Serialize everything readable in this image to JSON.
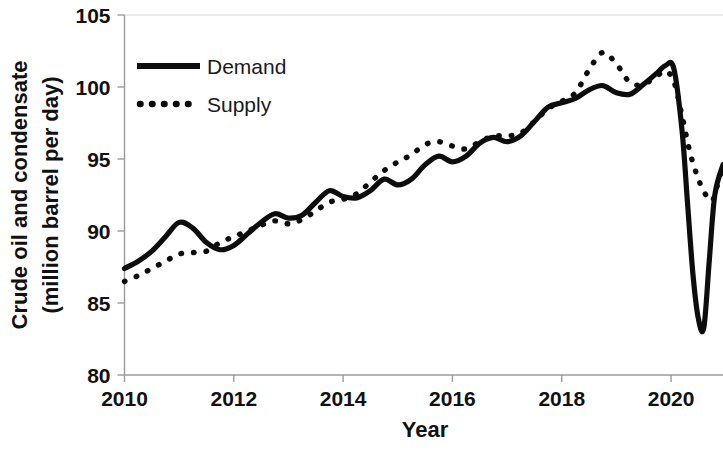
{
  "chart_data": {
    "type": "line",
    "title": "",
    "xlabel": "Year",
    "ylabel": "Crude oil and condensate (million barrel per day)",
    "ylabel_line1": "Crude oil and condensate",
    "ylabel_line2": "(million barrel per day)",
    "xlim": [
      2010.0,
      2020.95
    ],
    "ylim": [
      80,
      105
    ],
    "xticks": [
      2010,
      2012,
      2014,
      2016,
      2018,
      2020
    ],
    "xtick_labels": [
      "2010",
      "2012",
      "2014",
      "2016",
      "2018",
      "2020"
    ],
    "yticks": [
      80,
      85,
      90,
      95,
      100,
      105
    ],
    "ytick_labels": [
      "80",
      "85",
      "90",
      "95",
      "100",
      "105"
    ],
    "grid": false,
    "legend_position": "top-left",
    "colors": {
      "demand": "#0d0d0d",
      "supply": "#0d0d0d",
      "axis": "#9a9a9a"
    },
    "series": [
      {
        "name": "Demand",
        "style": "solid",
        "x": [
          2010.0,
          2010.25,
          2010.5,
          2010.75,
          2011.0,
          2011.25,
          2011.5,
          2011.75,
          2012.0,
          2012.25,
          2012.5,
          2012.75,
          2013.0,
          2013.25,
          2013.5,
          2013.75,
          2014.0,
          2014.25,
          2014.5,
          2014.75,
          2015.0,
          2015.25,
          2015.5,
          2015.75,
          2016.0,
          2016.25,
          2016.5,
          2016.75,
          2017.0,
          2017.25,
          2017.5,
          2017.75,
          2018.0,
          2018.25,
          2018.5,
          2018.75,
          2019.0,
          2019.25,
          2019.5,
          2019.75,
          2019.9,
          2020.05,
          2020.2,
          2020.3,
          2020.4,
          2020.5,
          2020.6,
          2020.7,
          2020.8,
          2020.95
        ],
        "y": [
          87.4,
          87.9,
          88.6,
          89.6,
          90.6,
          90.2,
          89.2,
          88.7,
          89.0,
          89.8,
          90.6,
          91.2,
          90.9,
          91.1,
          92.0,
          92.8,
          92.4,
          92.3,
          92.8,
          93.6,
          93.2,
          93.6,
          94.6,
          95.2,
          94.8,
          95.2,
          96.1,
          96.5,
          96.2,
          96.6,
          97.6,
          98.6,
          98.9,
          99.2,
          99.8,
          100.1,
          99.6,
          99.5,
          100.2,
          101.0,
          101.5,
          101.3,
          97.0,
          92.0,
          87.0,
          83.9,
          83.3,
          88.0,
          92.5,
          94.6
        ]
      },
      {
        "name": "Supply",
        "style": "dotted",
        "x": [
          2010.0,
          2010.25,
          2010.5,
          2010.75,
          2011.0,
          2011.25,
          2011.5,
          2011.75,
          2012.0,
          2012.25,
          2012.5,
          2012.75,
          2013.0,
          2013.25,
          2013.5,
          2013.75,
          2014.0,
          2014.25,
          2014.5,
          2014.75,
          2015.0,
          2015.25,
          2015.5,
          2015.75,
          2016.0,
          2016.25,
          2016.5,
          2016.75,
          2017.0,
          2017.25,
          2017.5,
          2017.75,
          2018.0,
          2018.25,
          2018.5,
          2018.75,
          2019.0,
          2019.25,
          2019.5,
          2019.75,
          2019.9,
          2020.05,
          2020.2,
          2020.35,
          2020.5,
          2020.62,
          2020.75,
          2020.85,
          2020.95
        ],
        "y": [
          86.5,
          86.9,
          87.4,
          87.9,
          88.4,
          88.5,
          88.6,
          89.2,
          89.6,
          90.0,
          90.4,
          90.7,
          90.5,
          90.8,
          91.4,
          92.0,
          92.2,
          92.6,
          93.4,
          94.2,
          94.8,
          95.3,
          96.0,
          96.2,
          95.9,
          95.7,
          96.2,
          96.6,
          96.6,
          96.8,
          97.6,
          98.5,
          99.0,
          99.6,
          101.2,
          102.4,
          101.6,
          100.3,
          100.2,
          100.8,
          101.1,
          100.4,
          98.0,
          95.4,
          93.6,
          92.6,
          92.1,
          93.2,
          94.6
        ]
      }
    ],
    "annotations": []
  },
  "legend": {
    "items": [
      {
        "label": "Demand",
        "style": "solid"
      },
      {
        "label": "Supply",
        "style": "dotted"
      }
    ]
  },
  "axes": {
    "x_title": "Year",
    "y_title_line1": "Crude oil and condensate",
    "y_title_line2": "(million barrel per day)"
  }
}
